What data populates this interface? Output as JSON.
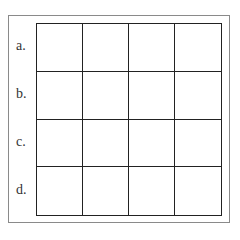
{
  "rows": [
    {
      "label": "a."
    },
    {
      "label": "b."
    },
    {
      "label": "c."
    },
    {
      "label": "d."
    }
  ],
  "grid": {
    "columns": 4,
    "rows": 4
  }
}
